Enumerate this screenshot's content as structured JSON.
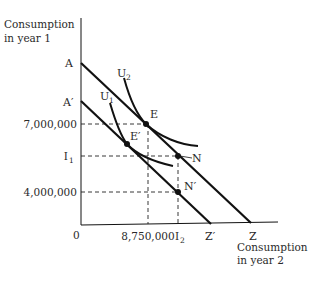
{
  "diagram": {
    "y_axis_title": [
      "Consumption",
      "in year 1"
    ],
    "x_axis_title": [
      "Consumption",
      "in year 2"
    ],
    "origin_label": "0",
    "y_ticks": [
      {
        "label": "7,000,000"
      },
      {
        "label": "I",
        "sub": "1"
      },
      {
        "label": "4,000,000"
      }
    ],
    "x_ticks": [
      {
        "label": "8,750,000"
      },
      {
        "label": "I",
        "sub": "2"
      }
    ],
    "intercepts": {
      "A": "A",
      "A_prime": "A′",
      "Z": "Z",
      "Z_prime": "Z′"
    },
    "curves": {
      "U1": {
        "label": "U",
        "sub": "1"
      },
      "U2": {
        "label": "U",
        "sub": "2"
      }
    },
    "points": {
      "E": "E",
      "E_prime": "E′",
      "N": "N",
      "N_prime": "N′"
    },
    "lines": [
      {
        "name": "budget-line-AZ",
        "from": "A",
        "to": "Z"
      },
      {
        "name": "budget-line-A-prime-Z-prime",
        "from": "A′",
        "to": "Z′"
      }
    ],
    "colors": {
      "ink": "#111111",
      "text": "#2a2a2a"
    }
  }
}
